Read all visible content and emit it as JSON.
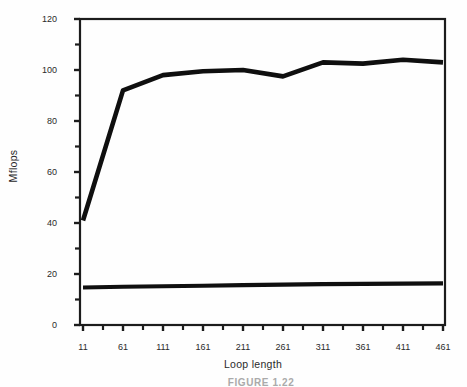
{
  "figure": {
    "ylabel": "Mflops",
    "xlabel": "Loop length",
    "partial_caption": "FIGURE 1.22"
  },
  "chart_data": {
    "type": "line",
    "title": "",
    "xlabel": "Loop length",
    "ylabel": "Mflops",
    "x": [
      11,
      61,
      111,
      161,
      211,
      261,
      311,
      361,
      411,
      461
    ],
    "series": [
      {
        "name": "upper",
        "values": [
          41,
          92,
          98,
          99.5,
          100,
          97.5,
          103,
          102.5,
          104,
          103
        ]
      },
      {
        "name": "lower",
        "values": [
          14.7,
          15.0,
          15.2,
          15.4,
          15.6,
          15.8,
          16.0,
          16.1,
          16.2,
          16.3
        ]
      }
    ],
    "xlim": [
      11,
      461
    ],
    "ylim": [
      0,
      120
    ],
    "x_tick_labels": [
      "11",
      "61",
      "111",
      "161",
      "211",
      "261",
      "311",
      "361",
      "411",
      "461"
    ],
    "y_tick_labels": [
      "0",
      "20",
      "40",
      "60",
      "80",
      "100",
      "120"
    ],
    "y_tick_step": 20,
    "y_minor_ticks": [
      10,
      30,
      50,
      70,
      90,
      110
    ],
    "x_minor_ticks": [
      36,
      86,
      136,
      186,
      236,
      286,
      336,
      386,
      436
    ],
    "grid": false,
    "legend": "none",
    "line_color": "#0f0f0f",
    "axis_color": "#1c1c1c"
  }
}
